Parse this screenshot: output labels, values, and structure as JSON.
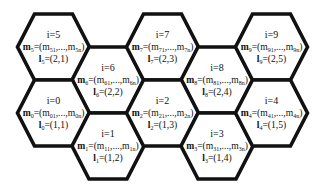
{
  "diagram": {
    "type": "hexagonal-grid",
    "stroke_color": "#111111",
    "fill_color": "#ffffff",
    "vector_symbol": "m",
    "location_symbol": "l",
    "ellipsis": ",...,",
    "last_subscript_suffix": "n",
    "cells": [
      {
        "i": "5",
        "index_label": "i=5",
        "m_sub": "5",
        "first_sub": "51",
        "last_sub": "5n",
        "l_value": "=(2,1)",
        "col": 0,
        "row": 0
      },
      {
        "i": "6",
        "index_label": "i=6",
        "m_sub": "6",
        "first_sub": "61",
        "last_sub": "6n",
        "l_value": "=(2,2)",
        "col": 1,
        "row": 0
      },
      {
        "i": "7",
        "index_label": "i=7",
        "m_sub": "7",
        "first_sub": "71",
        "last_sub": "7n",
        "l_value": "=(2,3)",
        "col": 2,
        "row": 0
      },
      {
        "i": "8",
        "index_label": "i=8",
        "m_sub": "8",
        "first_sub": "81",
        "last_sub": "8n",
        "l_value": "=(2,4)",
        "col": 3,
        "row": 0
      },
      {
        "i": "9",
        "index_label": "i=9",
        "m_sub": "9",
        "first_sub": "91",
        "last_sub": "9n",
        "l_value": "=(2,5)",
        "col": 4,
        "row": 0
      },
      {
        "i": "0",
        "index_label": "i=0",
        "m_sub": "0",
        "first_sub": "01",
        "last_sub": "0n",
        "l_value": "=(1,1)",
        "col": 0,
        "row": 1
      },
      {
        "i": "1",
        "index_label": "i=1",
        "m_sub": "1",
        "first_sub": "11",
        "last_sub": "1n",
        "l_value": "=(1,2)",
        "col": 1,
        "row": 1
      },
      {
        "i": "2",
        "index_label": "i=2",
        "m_sub": "2",
        "first_sub": "21",
        "last_sub": "2n",
        "l_value": "=(1,3)",
        "col": 2,
        "row": 1
      },
      {
        "i": "3",
        "index_label": "i=3",
        "m_sub": "3",
        "first_sub": "31",
        "last_sub": "3n",
        "l_value": "=(1,4)",
        "col": 3,
        "row": 1
      },
      {
        "i": "4",
        "index_label": "i=4",
        "m_sub": "4",
        "first_sub": "41",
        "last_sub": "4n",
        "l_value": "=(1,5)",
        "col": 4,
        "row": 1
      }
    ]
  }
}
